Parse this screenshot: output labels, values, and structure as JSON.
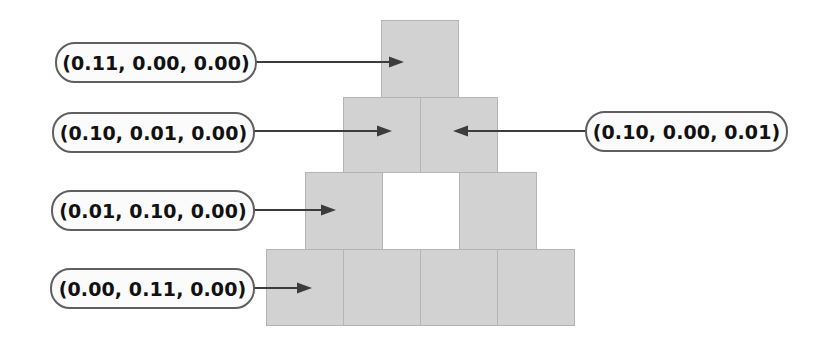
{
  "diagram": {
    "block_fill": "#d2d2d2",
    "block_stroke": "#b4b4b4",
    "callout_fill": "#fbfbfb",
    "callout_stroke": "#5f5f5f",
    "arrow_color": "#3c3c3c",
    "background": "#ffffff"
  },
  "callouts": [
    {
      "id": "callout-top",
      "text": "(0.11, 0.00, 0.00)",
      "side": "left",
      "target": "block-r1-c1"
    },
    {
      "id": "callout-row2-left",
      "text": "(0.10, 0.01, 0.00)",
      "side": "left",
      "target": "block-r2-c1"
    },
    {
      "id": "callout-row2-right",
      "text": "(0.10, 0.00, 0.01)",
      "side": "right",
      "target": "block-r2-c2"
    },
    {
      "id": "callout-row3-left",
      "text": "(0.01, 0.10, 0.00)",
      "side": "left",
      "target": "block-r3-c1"
    },
    {
      "id": "callout-row4-left",
      "text": "(0.00, 0.11, 0.00)",
      "side": "left",
      "target": "block-r4-c1"
    }
  ],
  "pyramid": {
    "rows": [
      {
        "row": 1,
        "blocks": [
          {
            "id": "block-r1-c1",
            "filled": true
          }
        ]
      },
      {
        "row": 2,
        "blocks": [
          {
            "id": "block-r2-c1",
            "filled": true
          },
          {
            "id": "block-r2-c2",
            "filled": true
          }
        ]
      },
      {
        "row": 3,
        "blocks": [
          {
            "id": "block-r3-c1",
            "filled": true
          },
          {
            "id": "block-r3-gap",
            "filled": false
          },
          {
            "id": "block-r3-c2",
            "filled": true
          }
        ]
      },
      {
        "row": 4,
        "blocks": [
          {
            "id": "block-r4-c1",
            "filled": true
          },
          {
            "id": "block-r4-c2",
            "filled": true
          },
          {
            "id": "block-r4-c3",
            "filled": true
          },
          {
            "id": "block-r4-c4",
            "filled": true
          }
        ]
      }
    ]
  }
}
